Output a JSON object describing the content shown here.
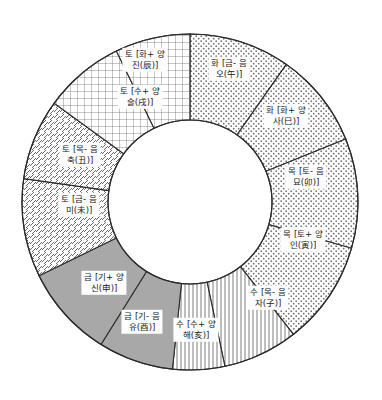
{
  "diagram": {
    "type": "donut-wheel",
    "center": {
      "x": 190,
      "y": 202
    },
    "outer_radius": 168,
    "inner_radius": 82,
    "colors": {
      "stroke": "#2b2b2b",
      "background": "#ffffff",
      "label_background": "#fdfdfd",
      "water_fill": "#a8a8a8",
      "earth_dot": "#6e6e6e",
      "hatch": "#5a5a5a"
    },
    "elements": [
      {
        "key": "earth",
        "name_ko": "토",
        "pattern": "dotted"
      },
      {
        "key": "fire",
        "name_ko": "화",
        "pattern": "grid"
      },
      {
        "key": "wood",
        "name_ko": "목",
        "pattern": "diagonal"
      },
      {
        "key": "water",
        "name_ko": "수",
        "pattern": "solid-gray"
      },
      {
        "key": "metal",
        "name_ko": "금",
        "pattern": "vertical"
      }
    ],
    "segments": [
      {
        "id": "seg-jin",
        "element": "earth",
        "pattern": "dotted",
        "start_angle": -90,
        "end_angle": -55,
        "line1": "토 [화+ 양",
        "line2": "진(辰)]",
        "label_x": 145,
        "label_y": 60
      },
      {
        "id": "seg-sul",
        "element": "earth",
        "pattern": "dotted",
        "start_angle": -55,
        "end_angle": -22,
        "line1": "토 [수+ 양",
        "line2": "술(戌)]",
        "label_x": 140,
        "label_y": 97
      },
      {
        "id": "seg-chuk",
        "element": "earth",
        "pattern": "dotted",
        "start_angle": -22,
        "end_angle": 16,
        "line1": "토 [목- 음",
        "line2": "축(丑)]",
        "label_x": 80,
        "label_y": 155
      },
      {
        "id": "seg-mi",
        "element": "earth",
        "pattern": "dotted",
        "start_angle": 16,
        "end_angle": 52,
        "line1": "토 [금- 음",
        "line2": "미(未)]",
        "label_x": 79,
        "label_y": 205
      },
      {
        "id": "seg-sin",
        "element": "metal",
        "pattern": "vertical",
        "start_angle": 52,
        "end_angle": 78,
        "line1": "금 [기+ 양",
        "line2": "신(申)]",
        "label_x": 104,
        "label_y": 283
      },
      {
        "id": "seg-yu",
        "element": "metal",
        "pattern": "vertical",
        "start_angle": 78,
        "end_angle": 96,
        "line1": "금 [기- 음",
        "line2": "유(酉)]",
        "label_x": 142,
        "label_y": 322
      },
      {
        "id": "seg-hae",
        "element": "water",
        "pattern": "solid-gray",
        "start_angle": 96,
        "end_angle": 122,
        "line1": "수 [수+ 양",
        "line2": "해(亥)]",
        "label_x": 196,
        "label_y": 330
      },
      {
        "id": "seg-ja",
        "element": "water",
        "pattern": "solid-gray",
        "start_angle": 122,
        "end_angle": 154,
        "line1": "수 [목- 음",
        "line2": "자(子)]",
        "label_x": 268,
        "label_y": 298
      },
      {
        "id": "seg-in",
        "element": "wood",
        "pattern": "diagonal",
        "start_angle": 154,
        "end_angle": 188,
        "line1": "목 [토+ 양",
        "line2": "인(寅)]",
        "label_x": 303,
        "label_y": 240
      },
      {
        "id": "seg-myo",
        "element": "wood",
        "pattern": "diagonal",
        "start_angle": 188,
        "end_angle": 216,
        "line1": "목 [토- 음",
        "line2": "묘(卯)]",
        "label_x": 306,
        "label_y": 177
      },
      {
        "id": "seg-sa",
        "element": "fire",
        "pattern": "grid",
        "start_angle": 216,
        "end_angle": 244,
        "line1": "화 [화+ 양",
        "line2": "사(巳)]",
        "label_x": 286,
        "label_y": 116
      },
      {
        "id": "seg-o",
        "element": "fire",
        "pattern": "grid",
        "start_angle": 244,
        "end_angle": 270,
        "line1": "화 [금- 음",
        "line2": "오(午)]",
        "label_x": 229,
        "label_y": 69
      }
    ]
  }
}
